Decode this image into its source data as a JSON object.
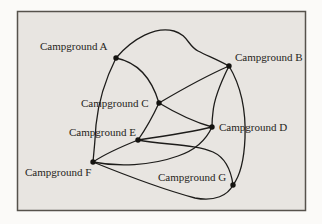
{
  "figure": {
    "name": "campground-trail-graph",
    "page_background": "#fbfaf8",
    "panel_background": "#e8e5e1",
    "border_color": "#56524c",
    "edge_color": "#1d1c1a",
    "node_dot_color": "#141310",
    "label_color": "#262420",
    "label_font_size": 11,
    "nodes": [
      {
        "id": "A",
        "label": "Campground A",
        "dot": {
          "x": 116,
          "y": 58
        },
        "label_pos": {
          "x": 40,
          "y": 50
        }
      },
      {
        "id": "B",
        "label": "Campground B",
        "dot": {
          "x": 229,
          "y": 66
        },
        "label_pos": {
          "x": 235,
          "y": 61
        }
      },
      {
        "id": "C",
        "label": "Campground C",
        "dot": {
          "x": 159,
          "y": 103
        },
        "label_pos": {
          "x": 81,
          "y": 107
        }
      },
      {
        "id": "D",
        "label": "Campground D",
        "dot": {
          "x": 212,
          "y": 127
        },
        "label_pos": {
          "x": 219,
          "y": 131
        }
      },
      {
        "id": "E",
        "label": "Campground E",
        "dot": {
          "x": 138,
          "y": 140
        },
        "label_pos": {
          "x": 69,
          "y": 136
        }
      },
      {
        "id": "F",
        "label": "Campground F",
        "dot": {
          "x": 93,
          "y": 162
        },
        "label_pos": {
          "x": 25,
          "y": 176
        }
      },
      {
        "id": "G",
        "label": "Campground G",
        "dot": {
          "x": 233,
          "y": 185
        },
        "label_pos": {
          "x": 158,
          "y": 181
        }
      }
    ],
    "edges": [
      {
        "from": "A",
        "to": "B",
        "path": "M116,58 C133,38 156,26 174,31 C188,35 188,46 198,51 C208,56 218,60 229,66"
      },
      {
        "from": "A",
        "to": "C",
        "path": "M116,58 C136,62 151,76 159,103"
      },
      {
        "from": "A",
        "to": "F",
        "path": "M116,58 C104,82 98,105 96,125 C95,142 94,152 93,162"
      },
      {
        "from": "B",
        "to": "C",
        "path": "M229,66 C206,76 181,90 159,103"
      },
      {
        "from": "B",
        "to": "D",
        "path": "M229,66 C221,82 214,100 213,112 C212,119 212,122 212,127"
      },
      {
        "from": "B",
        "to": "G",
        "path": "M229,66 C241,86 246,112 245,138 C244,162 240,176 233,185"
      },
      {
        "from": "C",
        "to": "D",
        "path": "M159,103 C174,112 194,122 212,127"
      },
      {
        "from": "C",
        "to": "E",
        "path": "M159,103 C153,116 145,130 138,140"
      },
      {
        "from": "D",
        "to": "E",
        "path": "M212,127 C192,132 165,136 138,140"
      },
      {
        "from": "D",
        "to": "F",
        "path": "M212,127 C206,140 196,150 178,156 C150,166 118,167 93,162"
      },
      {
        "from": "E",
        "to": "F",
        "path": "M138,140 C123,146 108,152 93,162"
      },
      {
        "from": "E",
        "to": "G",
        "path": "M138,140 C163,145 196,144 213,152 C226,158 231,170 233,185"
      },
      {
        "from": "F",
        "to": "G",
        "path": "M93,162 C125,175 165,190 195,198 C215,202 228,195 233,185"
      }
    ],
    "panel": {
      "x": 17.5,
      "y": 11.5,
      "width": 288,
      "height": 199
    }
  }
}
